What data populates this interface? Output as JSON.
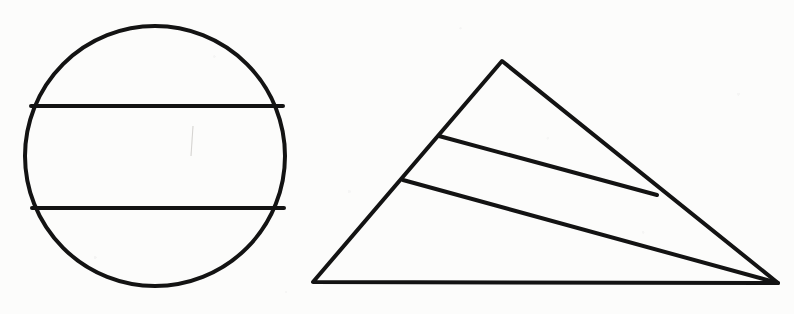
{
  "page": {
    "background_color": "#fcfcfb",
    "width": 794,
    "height": 314,
    "medium": "scanned line drawing on white paper"
  },
  "style": {
    "ink_color": "#131313",
    "stroke_width": 4,
    "thin_stroke_width": 3.4
  },
  "figures": [
    {
      "id": "figure-circle",
      "name": "circle-with-two-parallel-chords",
      "label": "Circle divided by two horizontal chords",
      "shape": "circle",
      "center": {
        "x": 155,
        "y": 156
      },
      "radius": 130,
      "regions": 3,
      "chords": [
        {
          "id": "chord-upper",
          "name": "upper-horizontal-chord",
          "x1": 31,
          "y1": 106,
          "x2": 283,
          "y2": 106,
          "orientation": "horizontal"
        },
        {
          "id": "chord-lower",
          "name": "lower-horizontal-chord",
          "x1": 32,
          "y1": 208,
          "x2": 284,
          "y2": 208,
          "orientation": "horizontal"
        }
      ]
    },
    {
      "id": "figure-triangle",
      "name": "triangle-with-two-cevians",
      "label": "Triangle divided by two internal lines",
      "shape": "triangle",
      "regions": 3,
      "vertices": [
        {
          "id": "apex",
          "name": "triangle-apex-vertex",
          "x": 502,
          "y": 61
        },
        {
          "id": "bottom-left",
          "name": "triangle-bottom-left-vertex",
          "x": 313,
          "y": 282
        },
        {
          "id": "bottom-right",
          "name": "triangle-bottom-right-vertex",
          "x": 778,
          "y": 283
        }
      ],
      "cevians": [
        {
          "id": "cevian-upper",
          "name": "upper-internal-line",
          "x1": 439,
          "y1": 136,
          "x2": 657,
          "y2": 195,
          "from_edge": "left-slant-edge",
          "to_edge": "right-slant-edge"
        },
        {
          "id": "cevian-lower",
          "name": "lower-internal-line",
          "x1": 403,
          "y1": 180,
          "x2": 778,
          "y2": 283,
          "from_edge": "left-slant-edge",
          "to_edge": "bottom-right-vertex"
        }
      ]
    }
  ]
}
